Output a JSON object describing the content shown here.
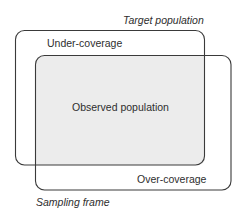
{
  "diagram": {
    "labels": {
      "target_population": "Target population",
      "under_coverage": "Under-coverage",
      "observed_population": "Observed population",
      "over_coverage": "Over-coverage",
      "sampling_frame": "Sampling frame"
    },
    "sets": [
      {
        "id": "target-population",
        "label": "Target population"
      },
      {
        "id": "sampling-frame",
        "label": "Sampling frame"
      }
    ],
    "regions": [
      {
        "id": "under-coverage",
        "description": "In target population but not in sampling frame"
      },
      {
        "id": "observed-population",
        "description": "Intersection of target population and sampling frame",
        "shaded": true
      },
      {
        "id": "over-coverage",
        "description": "In sampling frame but not in target population"
      }
    ],
    "colors": {
      "stroke": "#3a3a3a",
      "observed_fill": "#ececec",
      "text": "#2e2e2e"
    }
  }
}
